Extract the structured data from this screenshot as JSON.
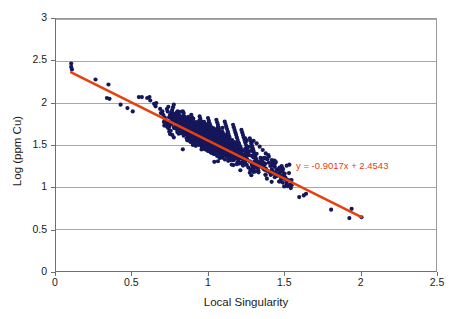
{
  "chart_data": {
    "type": "scatter",
    "title": "",
    "xlabel": "Local Singularity",
    "ylabel": "Log (ppm Cu)",
    "xlim": [
      0,
      2.5
    ],
    "ylim": [
      0,
      3
    ],
    "xticks": [
      "0",
      "0.5",
      "1",
      "1.5",
      "2",
      "2.5"
    ],
    "xtick_values": [
      0,
      0.5,
      1,
      1.5,
      2,
      2.5
    ],
    "yticks": [
      "0",
      "0.5",
      "1",
      "1.5",
      "2",
      "2.5",
      "3"
    ],
    "ytick_values": [
      0,
      0.5,
      1,
      1.5,
      2,
      2.5,
      3
    ],
    "grid": "horizontal",
    "legend": "none",
    "marker_color": "#15175a",
    "marker_size": 2.1,
    "annotations": [
      {
        "name": "regression-equation",
        "text": "y = -0.9017x + 2.4543",
        "color": "#e8400c",
        "x": 1.58,
        "y": 1.27
      }
    ],
    "trendline": {
      "name": "linear-regression-line",
      "equation": "y = -0.9017x + 2.4543",
      "slope": -0.9017,
      "intercept": 2.4543,
      "color": "#e8400c",
      "width": 2.6,
      "x_start": 0.1,
      "y_start": 2.364,
      "x_end": 2.01,
      "y_end": 0.642
    },
    "series": [
      {
        "name": "Local Singularity vs Log (ppm Cu)",
        "color": "#15175a",
        "points": [
          [
            0.1,
            2.47
          ],
          [
            0.1,
            2.43
          ],
          [
            0.105,
            2.4
          ],
          [
            0.26,
            2.28
          ],
          [
            0.345,
            2.22
          ],
          [
            0.335,
            2.06
          ],
          [
            0.352,
            2.05
          ],
          [
            0.425,
            1.98
          ],
          [
            0.47,
            1.94
          ],
          [
            0.505,
            1.9
          ],
          [
            0.545,
            2.07
          ],
          [
            0.565,
            2.07
          ],
          [
            0.6,
            2.06
          ],
          [
            0.615,
            2.07
          ],
          [
            0.62,
            2.03
          ],
          [
            0.645,
            1.99
          ],
          [
            0.655,
            1.96
          ],
          [
            0.66,
            2.0
          ],
          [
            0.685,
            1.93
          ],
          [
            0.69,
            1.88
          ],
          [
            0.7,
            1.9
          ],
          [
            0.705,
            1.86
          ],
          [
            0.715,
            1.83
          ],
          [
            0.72,
            1.8
          ],
          [
            0.73,
            1.78
          ],
          [
            0.735,
            1.74
          ],
          [
            0.74,
            1.7
          ],
          [
            0.745,
            1.66
          ],
          [
            0.75,
            1.63
          ],
          [
            0.755,
            1.83
          ],
          [
            0.76,
            1.88
          ],
          [
            0.765,
            1.92
          ],
          [
            0.77,
            1.95
          ],
          [
            0.775,
            1.98
          ],
          [
            0.78,
            1.86
          ],
          [
            0.785,
            1.82
          ],
          [
            0.79,
            1.79
          ],
          [
            0.795,
            1.76
          ],
          [
            0.8,
            1.9
          ],
          [
            0.805,
            1.86
          ],
          [
            0.81,
            1.83
          ],
          [
            0.815,
            1.79
          ],
          [
            0.82,
            1.76
          ],
          [
            0.825,
            1.72
          ],
          [
            0.83,
            1.69
          ],
          [
            0.835,
            1.66
          ],
          [
            0.84,
            1.88
          ],
          [
            0.845,
            1.84
          ],
          [
            0.85,
            1.81
          ],
          [
            0.855,
            1.78
          ],
          [
            0.86,
            1.75
          ],
          [
            0.865,
            1.72
          ],
          [
            0.87,
            1.69
          ],
          [
            0.875,
            1.66
          ],
          [
            0.88,
            1.63
          ],
          [
            0.885,
            1.6
          ],
          [
            0.89,
            1.86
          ],
          [
            0.895,
            1.83
          ],
          [
            0.9,
            1.8
          ],
          [
            0.905,
            1.77
          ],
          [
            0.91,
            1.74
          ],
          [
            0.915,
            1.71
          ],
          [
            0.92,
            1.68
          ],
          [
            0.925,
            1.65
          ],
          [
            0.93,
            1.62
          ],
          [
            0.935,
            1.59
          ],
          [
            0.94,
            1.56
          ],
          [
            0.945,
            1.84
          ],
          [
            0.95,
            1.81
          ],
          [
            0.955,
            1.78
          ],
          [
            0.96,
            1.75
          ],
          [
            0.965,
            1.72
          ],
          [
            0.97,
            1.69
          ],
          [
            0.975,
            1.66
          ],
          [
            0.98,
            1.63
          ],
          [
            0.985,
            1.6
          ],
          [
            0.99,
            1.57
          ],
          [
            0.995,
            1.54
          ],
          [
            1.0,
            1.82
          ],
          [
            1.005,
            1.79
          ],
          [
            1.01,
            1.76
          ],
          [
            1.015,
            1.73
          ],
          [
            1.02,
            1.7
          ],
          [
            1.025,
            1.67
          ],
          [
            1.03,
            1.64
          ],
          [
            1.035,
            1.61
          ],
          [
            1.04,
            1.58
          ],
          [
            1.045,
            1.55
          ],
          [
            1.05,
            1.52
          ],
          [
            1.055,
            1.8
          ],
          [
            1.06,
            1.77
          ],
          [
            1.065,
            1.74
          ],
          [
            1.07,
            1.71
          ],
          [
            1.075,
            1.68
          ],
          [
            1.08,
            1.65
          ],
          [
            1.085,
            1.62
          ],
          [
            1.09,
            1.59
          ],
          [
            1.095,
            1.56
          ],
          [
            1.1,
            1.53
          ],
          [
            1.105,
            1.5
          ],
          [
            1.11,
            1.78
          ],
          [
            1.115,
            1.75
          ],
          [
            1.12,
            1.72
          ],
          [
            1.125,
            1.69
          ],
          [
            1.13,
            1.66
          ],
          [
            1.135,
            1.63
          ],
          [
            1.14,
            1.6
          ],
          [
            1.145,
            1.57
          ],
          [
            1.15,
            1.54
          ],
          [
            1.155,
            1.51
          ],
          [
            1.16,
            1.48
          ],
          [
            1.165,
            1.74
          ],
          [
            1.17,
            1.71
          ],
          [
            1.175,
            1.68
          ],
          [
            1.18,
            1.65
          ],
          [
            1.185,
            1.62
          ],
          [
            1.19,
            1.59
          ],
          [
            1.195,
            1.56
          ],
          [
            1.2,
            1.53
          ],
          [
            1.205,
            1.5
          ],
          [
            1.21,
            1.47
          ],
          [
            1.215,
            1.44
          ],
          [
            1.22,
            1.68
          ],
          [
            1.225,
            1.65
          ],
          [
            1.23,
            1.62
          ],
          [
            1.235,
            1.59
          ],
          [
            1.24,
            1.56
          ],
          [
            1.245,
            1.53
          ],
          [
            1.25,
            1.5
          ],
          [
            1.255,
            1.47
          ],
          [
            1.26,
            1.44
          ],
          [
            1.265,
            1.41
          ],
          [
            1.27,
            1.38
          ],
          [
            1.275,
            1.58
          ],
          [
            1.28,
            1.55
          ],
          [
            1.285,
            1.52
          ],
          [
            1.29,
            1.49
          ],
          [
            1.295,
            1.46
          ],
          [
            1.3,
            1.43
          ],
          [
            1.305,
            1.4
          ],
          [
            1.31,
            1.37
          ],
          [
            1.315,
            1.34
          ],
          [
            1.32,
            1.31
          ],
          [
            1.245,
            1.58
          ],
          [
            1.255,
            1.55
          ],
          [
            1.275,
            1.17
          ],
          [
            1.28,
            1.2
          ],
          [
            1.285,
            1.14
          ],
          [
            1.29,
            1.22
          ],
          [
            1.3,
            1.18
          ],
          [
            1.31,
            1.25
          ],
          [
            1.33,
            1.3
          ],
          [
            1.335,
            1.27
          ],
          [
            1.34,
            1.24
          ],
          [
            1.35,
            1.34
          ],
          [
            1.36,
            1.3
          ],
          [
            1.37,
            1.26
          ],
          [
            1.38,
            1.22
          ],
          [
            1.39,
            1.33
          ],
          [
            1.4,
            1.29
          ],
          [
            1.41,
            1.25
          ],
          [
            1.42,
            1.21
          ],
          [
            1.425,
            1.17
          ],
          [
            1.43,
            1.28
          ],
          [
            1.44,
            1.24
          ],
          [
            1.45,
            1.2
          ],
          [
            1.46,
            1.21
          ],
          [
            1.47,
            1.17
          ],
          [
            1.475,
            1.13
          ],
          [
            1.48,
            1.09
          ],
          [
            1.49,
            1.19
          ],
          [
            1.5,
            1.15
          ],
          [
            1.51,
            1.11
          ],
          [
            1.52,
            1.07
          ],
          [
            1.55,
            1.02
          ],
          [
            1.63,
            0.9
          ],
          [
            1.645,
            0.92
          ],
          [
            1.6,
            0.88
          ],
          [
            1.81,
            0.73
          ],
          [
            1.93,
            0.63
          ],
          [
            1.945,
            0.74
          ],
          [
            2.01,
            0.64
          ],
          [
            0.78,
            1.7
          ],
          [
            0.8,
            1.67
          ],
          [
            0.82,
            1.64
          ],
          [
            0.84,
            1.61
          ],
          [
            0.86,
            1.58
          ],
          [
            0.88,
            1.55
          ],
          [
            0.9,
            1.52
          ],
          [
            0.92,
            1.49
          ],
          [
            0.94,
            1.5
          ],
          [
            0.96,
            1.47
          ],
          [
            0.98,
            1.45
          ],
          [
            1.0,
            1.43
          ],
          [
            1.02,
            1.41
          ],
          [
            1.04,
            1.39
          ],
          [
            1.06,
            1.37
          ],
          [
            1.08,
            1.35
          ],
          [
            0.745,
            1.72
          ],
          [
            0.755,
            1.67
          ],
          [
            0.765,
            1.62
          ],
          [
            0.775,
            1.59
          ],
          [
            1.3,
            1.55
          ],
          [
            1.32,
            1.52
          ],
          [
            1.34,
            1.48
          ],
          [
            1.36,
            1.44
          ],
          [
            1.38,
            1.4
          ],
          [
            1.4,
            1.36
          ],
          [
            1.42,
            1.32
          ],
          [
            1.44,
            1.28
          ]
        ]
      }
    ],
    "point_count_note": "dense navy cluster, ~2000 overplotted points"
  },
  "axis": {
    "x_title": "Local Singularity",
    "y_title": "Log (ppm Cu)"
  }
}
